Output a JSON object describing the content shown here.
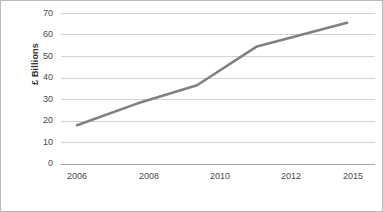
{
  "chart_data": {
    "type": "line",
    "title": "",
    "xlabel": "",
    "ylabel": "£ Billions",
    "categories": [
      "2006",
      "2008",
      "2010",
      "2012",
      "2015"
    ],
    "x": [
      2006,
      2008,
      2010,
      2012,
      2015
    ],
    "values": [
      18,
      28,
      36.5,
      54.5,
      65.5
    ],
    "series": [
      {
        "name": "£ Billions",
        "values": [
          18,
          28,
          36.5,
          54.5,
          65.5
        ],
        "color": "#808080"
      }
    ],
    "ylim": [
      0,
      70
    ],
    "ytick_labels": [
      "0",
      "10",
      "20",
      "30",
      "40",
      "50",
      "60",
      "70"
    ],
    "ytick_values": [
      0,
      10,
      20,
      30,
      40,
      50,
      60,
      70
    ],
    "xtick_labels": [
      "2006",
      "2008",
      "2010",
      "2012",
      "2015"
    ],
    "grid": "horizontal",
    "legend": "none",
    "line_color": "#808080",
    "grid_color": "#d2d2d2",
    "axis_color": "#a6a6a6",
    "border_color": "#b9b9b9",
    "background": "#ffffff"
  },
  "axis": {
    "y_label": "£ Billions",
    "y_ticks": [
      {
        "label": "70",
        "value": 70
      },
      {
        "label": "60",
        "value": 60
      },
      {
        "label": "50",
        "value": 50
      },
      {
        "label": "40",
        "value": 40
      },
      {
        "label": "30",
        "value": 30
      },
      {
        "label": "20",
        "value": 20
      },
      {
        "label": "10",
        "value": 10
      },
      {
        "label": "0",
        "value": 0
      }
    ],
    "x_ticks": [
      {
        "label": "2006"
      },
      {
        "label": "2008"
      },
      {
        "label": "2010"
      },
      {
        "label": "2012"
      },
      {
        "label": "2015"
      }
    ]
  }
}
